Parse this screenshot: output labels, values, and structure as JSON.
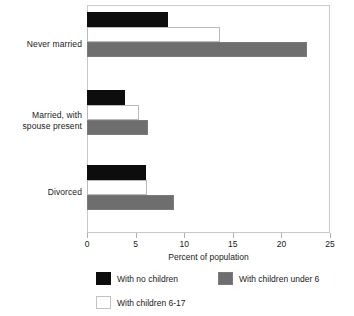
{
  "chart_data": {
    "type": "bar",
    "orientation": "horizontal",
    "title": "",
    "xlabel": "Percent of population",
    "ylabel": "",
    "xlim": [
      0,
      25
    ],
    "xticks": [
      0,
      5,
      10,
      15,
      20,
      25
    ],
    "xtick_labels": [
      "0",
      "5",
      "10",
      "15",
      "20",
      "25"
    ],
    "grid": false,
    "legend_position": "bottom",
    "categories": [
      "Never married",
      "Married, with spouse present",
      "Divorced"
    ],
    "category_label_lines": [
      [
        "Never married"
      ],
      [
        "Married, with",
        "spouse present"
      ],
      [
        "Divorced"
      ]
    ],
    "series": [
      {
        "name": "With no children",
        "color": "#0d0d0d",
        "values": [
          8.3,
          3.9,
          6.1
        ]
      },
      {
        "name": "With children 6-17",
        "color": "#ffffff",
        "values": [
          13.7,
          5.4,
          6.2
        ]
      },
      {
        "name": "With children under 6",
        "color": "#6e6e6e",
        "values": [
          22.6,
          6.3,
          8.9
        ]
      }
    ],
    "bars": [
      {
        "category": "Never married",
        "series": "With no children",
        "value": 8.3,
        "style": "black"
      },
      {
        "category": "Never married",
        "series": "With children 6-17",
        "value": 13.7,
        "style": "white"
      },
      {
        "category": "Never married",
        "series": "With children under 6",
        "value": 22.6,
        "style": "gray"
      },
      {
        "category": "Married, with spouse present",
        "series": "With no children",
        "value": 3.9,
        "style": "black"
      },
      {
        "category": "Married, with spouse present",
        "series": "With children 6-17",
        "value": 5.4,
        "style": "white"
      },
      {
        "category": "Married, with spouse present",
        "series": "With children under 6",
        "value": 6.3,
        "style": "gray"
      },
      {
        "category": "Divorced",
        "series": "With no children",
        "value": 6.1,
        "style": "black"
      },
      {
        "category": "Divorced",
        "series": "With children 6-17",
        "value": 6.2,
        "style": "white"
      },
      {
        "category": "Divorced",
        "series": "With children under 6",
        "value": 8.9,
        "style": "gray"
      }
    ]
  },
  "axis": {
    "x_title": "Percent of population",
    "ticks": [
      "0",
      "5",
      "10",
      "15",
      "20",
      "25"
    ]
  },
  "categories": {
    "cat0_line0": "Never married",
    "cat1_line0": "Married, with",
    "cat1_line1": "spouse present",
    "cat2_line0": "Divorced"
  },
  "legend": {
    "items": [
      {
        "label": "With no children",
        "style": "black",
        "color": "#0d0d0d"
      },
      {
        "label": "With children under 6",
        "style": "gray",
        "color": "#6e6e6e"
      },
      {
        "label": "With children 6-17",
        "style": "white",
        "color": "#ffffff"
      }
    ]
  },
  "colors": {
    "black": "#0d0d0d",
    "gray": "#6e6e6e",
    "white": "#ffffff",
    "frame": "#c9c9c9",
    "text": "#1a1a1a"
  }
}
